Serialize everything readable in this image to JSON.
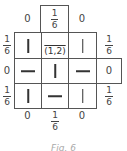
{
  "figure": {
    "center_label": "(1,2)",
    "caption": "Fig. 6",
    "top_cell": {
      "num": "1",
      "den": "6"
    },
    "outer_labels": {
      "top_left": "0",
      "top_right": "0",
      "row1_left": {
        "num": "1",
        "den": "6"
      },
      "row1_right": {
        "num": "1",
        "den": "6"
      },
      "row2_left": "0",
      "row2_right_cell": "0",
      "row3_left": {
        "num": "1",
        "den": "6"
      },
      "row3_right": {
        "num": "1",
        "den": "6"
      },
      "bottom_left": "0",
      "bottom_mid": {
        "num": "1",
        "den": "6"
      },
      "bottom_right": "0"
    },
    "grid": [
      [
        "vertical",
        "center",
        "vertical"
      ],
      [
        "horizontal",
        "vertical",
        "horizontal"
      ],
      [
        "vertical",
        "horizontal",
        "vertical"
      ]
    ]
  }
}
